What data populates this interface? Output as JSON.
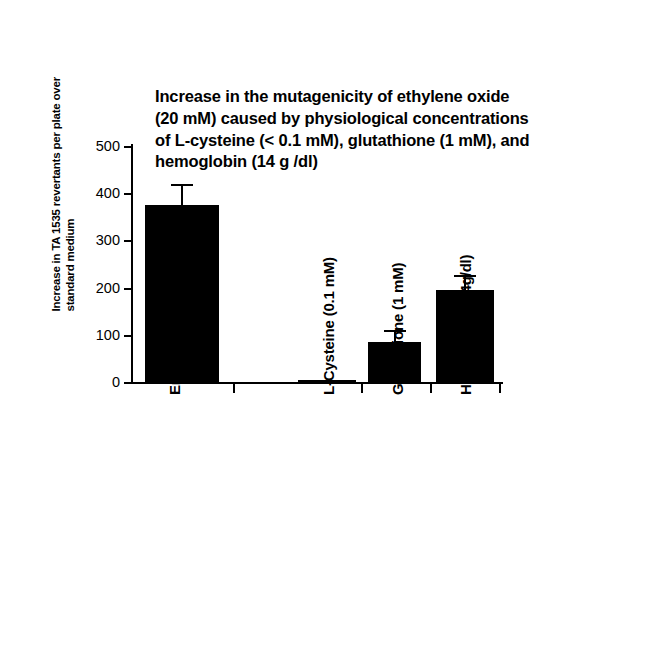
{
  "chart_data": {
    "type": "bar",
    "title": "Increase in the mutagenicity of ethylene oxide (20 mM) caused by physiological concentrations of L-cysteine (< 0.1 mM), glutathione (1 mM), and hemoglobin (14 g /dl)",
    "title_lines": [
      "Increase in the mutagenicity of ethylene oxide",
      "(20 mM) caused by physiological concentrations",
      "of L-cysteine (< 0.1 mM), glutathione (1 mM), and",
      "hemoglobin (14 g /dl)"
    ],
    "xlabel": "",
    "ylabel": "Increase in TA 1535 revertants per plate over standard medium",
    "ylabel_lines": [
      "Increase in TA 1535 revertants per plate over",
      "standard medium"
    ],
    "ylim": [
      0,
      500
    ],
    "yticks": [
      500,
      400,
      300,
      200,
      100,
      0
    ],
    "ytick_labels": [
      "500",
      "400",
      "300",
      "200",
      "100",
      "0"
    ],
    "grid": false,
    "legend": "none",
    "categories": [
      "Erythrocyte homogenate",
      "L-Cysteine (0.1 mM)",
      "Glutathione (1 mM)",
      "Hemoglobin (14g/dl)"
    ],
    "values": [
      375,
      5,
      85,
      195
    ],
    "errors": [
      40,
      0,
      20,
      27
    ],
    "bar_color": "#000000",
    "axis_color": "#000000"
  }
}
